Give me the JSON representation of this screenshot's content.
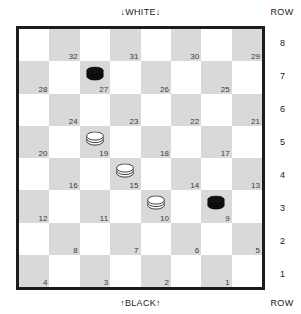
{
  "figure": {
    "type": "checkers-board",
    "top_label": "↓WHITE↓",
    "bottom_label": "↑BLACK↑",
    "row_header_top": "ROW",
    "row_header_bottom": "ROW",
    "row_numbers": [
      "8",
      "7",
      "6",
      "5",
      "4",
      "3",
      "2",
      "1"
    ]
  },
  "colors": {
    "light_square": "#ffffff",
    "dark_square": "#d9d9d9",
    "border": "#1c1c1c",
    "black_piece": "#111111",
    "white_piece": "#ffffff",
    "number_text": "#3a3a3a",
    "label_text": "#1a1a1a"
  },
  "board": {
    "rows": [
      {
        "row": "8",
        "squares": [
          {
            "shade": "light",
            "number": "",
            "piece": ""
          },
          {
            "shade": "dark",
            "number": "32",
            "piece": ""
          },
          {
            "shade": "light",
            "number": "",
            "piece": ""
          },
          {
            "shade": "dark",
            "number": "31",
            "piece": ""
          },
          {
            "shade": "light",
            "number": "",
            "piece": ""
          },
          {
            "shade": "dark",
            "number": "30",
            "piece": ""
          },
          {
            "shade": "light",
            "number": "",
            "piece": ""
          },
          {
            "shade": "dark",
            "number": "29",
            "piece": ""
          }
        ]
      },
      {
        "row": "7",
        "squares": [
          {
            "shade": "dark",
            "number": "28",
            "piece": ""
          },
          {
            "shade": "light",
            "number": "",
            "piece": ""
          },
          {
            "shade": "dark",
            "number": "27",
            "piece": "black-king"
          },
          {
            "shade": "light",
            "number": "",
            "piece": ""
          },
          {
            "shade": "dark",
            "number": "26",
            "piece": ""
          },
          {
            "shade": "light",
            "number": "",
            "piece": ""
          },
          {
            "shade": "dark",
            "number": "25",
            "piece": ""
          },
          {
            "shade": "light",
            "number": "",
            "piece": ""
          }
        ]
      },
      {
        "row": "6",
        "squares": [
          {
            "shade": "light",
            "number": "",
            "piece": ""
          },
          {
            "shade": "dark",
            "number": "24",
            "piece": ""
          },
          {
            "shade": "light",
            "number": "",
            "piece": ""
          },
          {
            "shade": "dark",
            "number": "23",
            "piece": ""
          },
          {
            "shade": "light",
            "number": "",
            "piece": ""
          },
          {
            "shade": "dark",
            "number": "22",
            "piece": ""
          },
          {
            "shade": "light",
            "number": "",
            "piece": ""
          },
          {
            "shade": "dark",
            "number": "21",
            "piece": ""
          }
        ]
      },
      {
        "row": "5",
        "squares": [
          {
            "shade": "dark",
            "number": "20",
            "piece": ""
          },
          {
            "shade": "light",
            "number": "",
            "piece": ""
          },
          {
            "shade": "dark",
            "number": "19",
            "piece": "white-king"
          },
          {
            "shade": "light",
            "number": "",
            "piece": ""
          },
          {
            "shade": "dark",
            "number": "18",
            "piece": ""
          },
          {
            "shade": "light",
            "number": "",
            "piece": ""
          },
          {
            "shade": "dark",
            "number": "17",
            "piece": ""
          },
          {
            "shade": "light",
            "number": "",
            "piece": ""
          }
        ]
      },
      {
        "row": "4",
        "squares": [
          {
            "shade": "light",
            "number": "",
            "piece": ""
          },
          {
            "shade": "dark",
            "number": "16",
            "piece": ""
          },
          {
            "shade": "light",
            "number": "",
            "piece": ""
          },
          {
            "shade": "dark",
            "number": "15",
            "piece": "white-king"
          },
          {
            "shade": "light",
            "number": "",
            "piece": ""
          },
          {
            "shade": "dark",
            "number": "14",
            "piece": ""
          },
          {
            "shade": "light",
            "number": "",
            "piece": ""
          },
          {
            "shade": "dark",
            "number": "13",
            "piece": ""
          }
        ]
      },
      {
        "row": "3",
        "squares": [
          {
            "shade": "dark",
            "number": "12",
            "piece": ""
          },
          {
            "shade": "light",
            "number": "",
            "piece": ""
          },
          {
            "shade": "dark",
            "number": "11",
            "piece": ""
          },
          {
            "shade": "light",
            "number": "",
            "piece": ""
          },
          {
            "shade": "dark",
            "number": "10",
            "piece": "white-king"
          },
          {
            "shade": "light",
            "number": "",
            "piece": ""
          },
          {
            "shade": "dark",
            "number": "9",
            "piece": "black-king"
          },
          {
            "shade": "light",
            "number": "",
            "piece": ""
          }
        ]
      },
      {
        "row": "2",
        "squares": [
          {
            "shade": "light",
            "number": "",
            "piece": ""
          },
          {
            "shade": "dark",
            "number": "8",
            "piece": ""
          },
          {
            "shade": "light",
            "number": "",
            "piece": ""
          },
          {
            "shade": "dark",
            "number": "7",
            "piece": ""
          },
          {
            "shade": "light",
            "number": "",
            "piece": ""
          },
          {
            "shade": "dark",
            "number": "6",
            "piece": ""
          },
          {
            "shade": "light",
            "number": "",
            "piece": ""
          },
          {
            "shade": "dark",
            "number": "5",
            "piece": ""
          }
        ]
      },
      {
        "row": "1",
        "squares": [
          {
            "shade": "dark",
            "number": "4",
            "piece": ""
          },
          {
            "shade": "light",
            "number": "",
            "piece": ""
          },
          {
            "shade": "dark",
            "number": "3",
            "piece": ""
          },
          {
            "shade": "light",
            "number": "",
            "piece": ""
          },
          {
            "shade": "dark",
            "number": "2",
            "piece": ""
          },
          {
            "shade": "light",
            "number": "",
            "piece": ""
          },
          {
            "shade": "dark",
            "number": "1",
            "piece": ""
          },
          {
            "shade": "light",
            "number": "",
            "piece": ""
          }
        ]
      }
    ]
  },
  "position_summary": {
    "black_kings": [
      "27",
      "9"
    ],
    "white_kings": [
      "19",
      "15",
      "10"
    ],
    "black_men": [],
    "white_men": []
  }
}
